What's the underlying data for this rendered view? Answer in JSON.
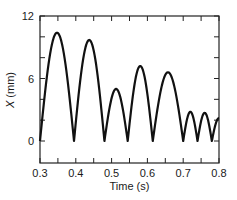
{
  "chart_data": {
    "type": "line",
    "title": "",
    "xlabel": "Time (s)",
    "ylabel": "X (mm)",
    "ylabel_italic_symbol": "X",
    "ylabel_units": " (mm)",
    "xlim": [
      0.3,
      0.8
    ],
    "ylim": [
      -2.1,
      12
    ],
    "xticks": [
      0.3,
      0.4,
      0.5,
      0.6,
      0.7,
      0.8
    ],
    "xtick_labels": [
      "0.3",
      "0.4",
      "0.5",
      "0.6",
      "0.7",
      "0.8"
    ],
    "xminor_ticks": [
      0.35,
      0.45,
      0.55,
      0.65,
      0.75
    ],
    "yticks": [
      0,
      6,
      12
    ],
    "ytick_labels": [
      "0",
      "6",
      "12"
    ],
    "yminor_ticks": [
      2,
      4,
      8,
      10
    ],
    "grid": false,
    "legend": null,
    "series": [
      {
        "name": "X",
        "color": "#111111",
        "description": "rectified oscillation: sequence of arches returning to zero",
        "arches": [
          {
            "start": 0.3,
            "end": 0.395,
            "peak": 10.4
          },
          {
            "start": 0.395,
            "end": 0.48,
            "peak": 9.7
          },
          {
            "start": 0.48,
            "end": 0.545,
            "peak": 5.0
          },
          {
            "start": 0.545,
            "end": 0.615,
            "peak": 7.2
          },
          {
            "start": 0.615,
            "end": 0.7,
            "peak": 6.6
          },
          {
            "start": 0.7,
            "end": 0.74,
            "peak": 2.8
          },
          {
            "start": 0.74,
            "end": 0.78,
            "peak": 2.7
          },
          {
            "start": 0.78,
            "end": 0.82,
            "peak": 2.2
          }
        ],
        "x": [
          0.3,
          0.345,
          0.395,
          0.44,
          0.48,
          0.512,
          0.545,
          0.58,
          0.615,
          0.655,
          0.7,
          0.72,
          0.74,
          0.76,
          0.78,
          0.8
        ],
        "y": [
          0,
          10.4,
          0,
          9.7,
          0,
          5.0,
          0,
          7.2,
          0,
          6.6,
          0,
          2.8,
          0,
          2.7,
          0,
          2.1
        ]
      }
    ]
  }
}
